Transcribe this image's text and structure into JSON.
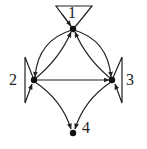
{
  "diagram": {
    "type": "directed-graph",
    "nodes": [
      {
        "id": "1",
        "label": "1"
      },
      {
        "id": "2",
        "label": "2"
      },
      {
        "id": "3",
        "label": "3"
      },
      {
        "id": "4",
        "label": "4"
      }
    ],
    "edges": [
      {
        "from": "1",
        "to": "1",
        "kind": "self-loop"
      },
      {
        "from": "2",
        "to": "2",
        "kind": "self-loop"
      },
      {
        "from": "3",
        "to": "3",
        "kind": "self-loop"
      },
      {
        "from": "1",
        "to": "2"
      },
      {
        "from": "2",
        "to": "1"
      },
      {
        "from": "1",
        "to": "3"
      },
      {
        "from": "3",
        "to": "1"
      },
      {
        "from": "2",
        "to": "3"
      },
      {
        "from": "2",
        "to": "4"
      },
      {
        "from": "3",
        "to": "4"
      }
    ],
    "colors": {
      "stroke": "#222222",
      "background": "#ffffff"
    }
  }
}
